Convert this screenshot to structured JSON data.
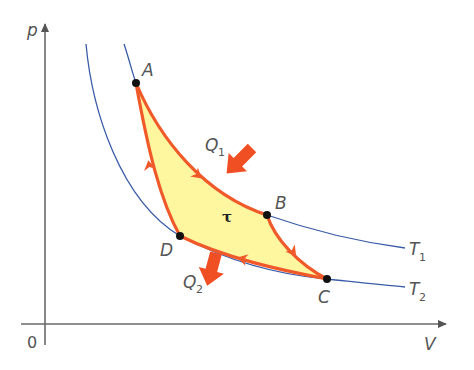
{
  "diagram": {
    "axes": {
      "y_label": "p",
      "x_label": "V",
      "origin_label": "0"
    },
    "isotherms": [
      {
        "label": "T",
        "subscript": "1",
        "color": "#3a5ca8"
      },
      {
        "label": "T",
        "subscript": "2",
        "color": "#3a5ca8"
      }
    ],
    "points": [
      {
        "label": "A"
      },
      {
        "label": "B"
      },
      {
        "label": "C"
      },
      {
        "label": "D"
      }
    ],
    "heat": {
      "in": {
        "label": "Q",
        "subscript": "1"
      },
      "out": {
        "label": "Q",
        "subscript": "2"
      }
    },
    "work_label": "τ",
    "colors": {
      "cycle_stroke": "#f05a2a",
      "cycle_fill": "#fff7a0",
      "isotherm": "#3a5ca8",
      "axis": "#666666",
      "point": "#111111",
      "heat_arrow": "#f04e23"
    }
  }
}
